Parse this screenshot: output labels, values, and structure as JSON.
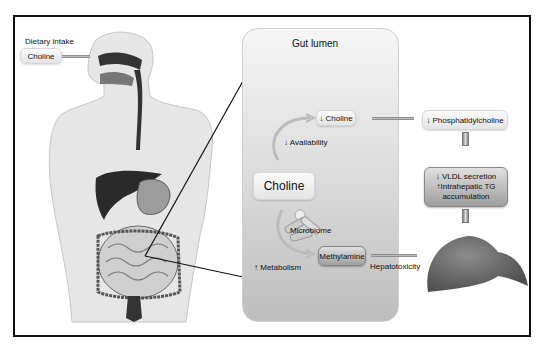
{
  "figure": {
    "left_panel": {
      "dietary_intake_label": "Dietary intake",
      "choline_label": "Choline",
      "illustration": "human-digestive-system"
    },
    "gut_lumen": {
      "title": "Gut lumen",
      "reduced_choline": "↓ Choline",
      "reduced_availability": "↓ Availability",
      "choline_center": "Choline",
      "microbiome": "Microbiome",
      "methylamine": "Methylamine",
      "increased_metabolism": "↑ Metabolism"
    },
    "right_panel": {
      "phosphatidylcholine": "↓ Phosphatidylcholine",
      "vldl_line1": "↓ VLDL secretion",
      "vldl_line2": "↑Intrahepatic TG",
      "vldl_line3": "accumulation",
      "hepatotoxicity": "Hepatotoxicity",
      "illustration": "liver"
    },
    "colors": {
      "frame": "#111111",
      "gut_panel_top": "#f6f6f6",
      "gut_panel_bottom": "#bdbdbd",
      "arrow": "#8a8a8a",
      "liver": "#6e6e6e"
    }
  }
}
